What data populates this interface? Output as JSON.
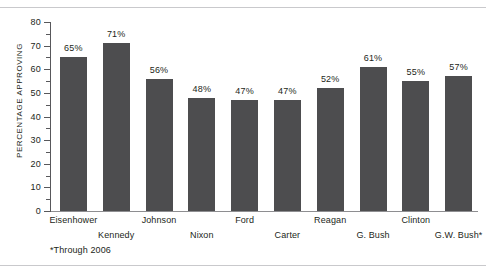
{
  "chart_data": {
    "type": "bar",
    "title": "",
    "subtitle": "",
    "xlabel": "",
    "ylabel": "PERCENTAGE APPROVING",
    "ylim": [
      0,
      80
    ],
    "ytick_interval": 10,
    "yminor_interval": 5,
    "grid": false,
    "legend": null,
    "bar_color": "#4d4d4f",
    "categories": [
      "Eisenhower",
      "Kennedy",
      "Johnson",
      "Nixon",
      "Ford",
      "Carter",
      "Reagan",
      "G. Bush",
      "Clinton",
      "G.W. Bush*"
    ],
    "values": [
      65,
      71,
      56,
      48,
      47,
      47,
      52,
      61,
      55,
      57
    ],
    "data_labels": [
      "65%",
      "71%",
      "56%",
      "48%",
      "47%",
      "47%",
      "52%",
      "61%",
      "55%",
      "57%"
    ],
    "ytick_labels": [
      "0",
      "10",
      "20",
      "30",
      "40",
      "50",
      "60",
      "70",
      "80"
    ],
    "annotations": [
      "*Through 2006"
    ]
  },
  "footnote": "*Through 2006"
}
